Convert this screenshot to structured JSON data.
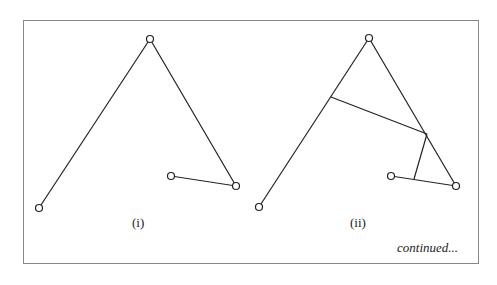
{
  "frame": {
    "x": 23,
    "y": 20,
    "w": 455,
    "h": 243,
    "stroke": "#888"
  },
  "panels": [
    {
      "label": "(i)",
      "label_pos": [
        132,
        215
      ],
      "points": [
        [
          39,
          208
        ],
        [
          150,
          39
        ],
        [
          236,
          186
        ],
        [
          171,
          176
        ]
      ],
      "segments": [
        [
          [
            39,
            208
          ],
          [
            150,
            39
          ]
        ],
        [
          [
            150,
            39
          ],
          [
            236,
            186
          ]
        ],
        [
          [
            236,
            186
          ],
          [
            171,
            176
          ]
        ]
      ]
    },
    {
      "label": "(ii)",
      "label_pos": [
        350,
        215
      ],
      "points": [
        [
          259,
          207
        ],
        [
          369,
          38
        ],
        [
          456,
          186
        ],
        [
          391,
          176
        ]
      ],
      "segments": [
        [
          [
            259,
            207
          ],
          [
            369,
            38
          ]
        ],
        [
          [
            369,
            38
          ],
          [
            456,
            186
          ]
        ],
        [
          [
            456,
            186
          ],
          [
            391,
            176
          ]
        ],
        [
          [
            331,
            97
          ],
          [
            427,
            134
          ]
        ],
        [
          [
            427,
            134
          ],
          [
            414,
            179
          ]
        ]
      ]
    }
  ],
  "footer": {
    "text": "continued...",
    "pos": [
      397,
      240
    ]
  },
  "colors": {
    "line": "#222",
    "frame": "#888"
  }
}
